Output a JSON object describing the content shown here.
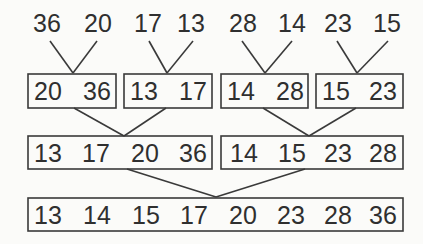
{
  "input": {
    "values": [
      "36",
      "20",
      "17",
      "13",
      "28",
      "14",
      "23",
      "15"
    ]
  },
  "level1": {
    "groups": [
      {
        "values": [
          "20",
          "36"
        ]
      },
      {
        "values": [
          "13",
          "17"
        ]
      },
      {
        "values": [
          "14",
          "28"
        ]
      },
      {
        "values": [
          "15",
          "23"
        ]
      }
    ]
  },
  "level2": {
    "groups": [
      {
        "values": [
          "13",
          "17",
          "20",
          "36"
        ]
      },
      {
        "values": [
          "14",
          "15",
          "23",
          "28"
        ]
      }
    ]
  },
  "level3": {
    "groups": [
      {
        "values": [
          "13",
          "14",
          "15",
          "17",
          "20",
          "23",
          "28",
          "36"
        ]
      }
    ]
  },
  "colors": {
    "line": "#3a3a3a",
    "text": "#2f2f2f",
    "background": "#fbfbf9"
  }
}
